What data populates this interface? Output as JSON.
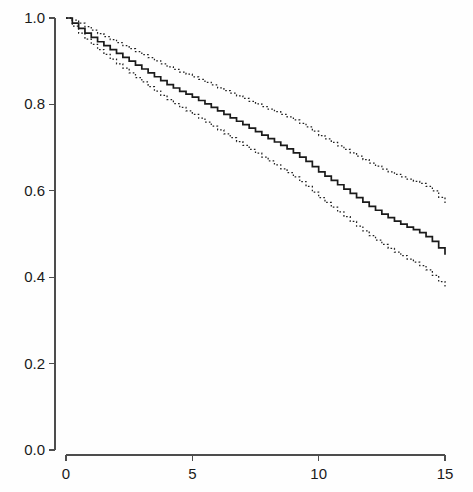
{
  "chart_data": {
    "type": "line",
    "title": "",
    "subtitle": "",
    "xlabel": "",
    "ylabel": "",
    "xlim": [
      0,
      15
    ],
    "ylim": [
      0.0,
      1.0
    ],
    "grid": false,
    "legend": "none",
    "style": "kaplan-meier survival curve with 95% confidence bands",
    "xticks": [
      0,
      5,
      10,
      15
    ],
    "xtick_labels": [
      "0",
      "5",
      "10",
      "15"
    ],
    "yticks": [
      0.0,
      0.2,
      0.4,
      0.6,
      0.8,
      1.0
    ],
    "ytick_labels": [
      "0.0",
      "0.2",
      "0.4",
      "0.6",
      "0.8",
      "1.0"
    ],
    "colors": {
      "estimate": "#1a1a1a",
      "confidence_band": "#1f1f1f",
      "axis": "#4d4d4d",
      "background": "#fefefe"
    },
    "x": [
      0,
      0.25,
      0.5,
      0.75,
      1,
      1.25,
      1.5,
      1.75,
      2,
      2.25,
      2.5,
      2.75,
      3,
      3.25,
      3.5,
      3.75,
      4,
      4.25,
      4.5,
      4.75,
      5,
      5.25,
      5.5,
      5.75,
      6,
      6.25,
      6.5,
      6.75,
      7,
      7.25,
      7.5,
      7.75,
      8,
      8.25,
      8.5,
      8.75,
      9,
      9.25,
      9.5,
      9.75,
      10,
      10.25,
      10.5,
      10.75,
      11,
      11.25,
      11.5,
      11.75,
      12,
      12.25,
      12.5,
      12.75,
      13,
      13.25,
      13.5,
      13.75,
      14,
      14.25,
      14.5,
      14.75,
      15
    ],
    "series": [
      {
        "name": "Survival estimate",
        "linestyle": "solid",
        "values": [
          1.0,
          0.988,
          0.976,
          0.965,
          0.955,
          0.945,
          0.936,
          0.927,
          0.918,
          0.909,
          0.9,
          0.891,
          0.882,
          0.873,
          0.864,
          0.855,
          0.846,
          0.838,
          0.83,
          0.824,
          0.817,
          0.809,
          0.801,
          0.793,
          0.785,
          0.777,
          0.769,
          0.761,
          0.753,
          0.745,
          0.737,
          0.729,
          0.721,
          0.713,
          0.705,
          0.697,
          0.688,
          0.678,
          0.668,
          0.656,
          0.644,
          0.634,
          0.624,
          0.614,
          0.604,
          0.594,
          0.584,
          0.574,
          0.564,
          0.555,
          0.546,
          0.538,
          0.53,
          0.523,
          0.516,
          0.51,
          0.503,
          0.494,
          0.483,
          0.468,
          0.452
        ]
      },
      {
        "name": "Upper 95% confidence limit",
        "linestyle": "dotted",
        "values": [
          1.0,
          0.995,
          0.988,
          0.98,
          0.972,
          0.964,
          0.957,
          0.95,
          0.943,
          0.936,
          0.929,
          0.922,
          0.915,
          0.908,
          0.901,
          0.894,
          0.887,
          0.881,
          0.875,
          0.87,
          0.864,
          0.858,
          0.851,
          0.845,
          0.838,
          0.832,
          0.826,
          0.82,
          0.814,
          0.807,
          0.801,
          0.795,
          0.789,
          0.783,
          0.777,
          0.771,
          0.764,
          0.756,
          0.748,
          0.738,
          0.728,
          0.72,
          0.712,
          0.704,
          0.696,
          0.688,
          0.68,
          0.672,
          0.664,
          0.657,
          0.65,
          0.644,
          0.638,
          0.632,
          0.627,
          0.622,
          0.617,
          0.61,
          0.6,
          0.585,
          0.57
        ]
      },
      {
        "name": "Lower 95% confidence limit",
        "linestyle": "dotted",
        "values": [
          1.0,
          0.981,
          0.965,
          0.951,
          0.939,
          0.927,
          0.916,
          0.905,
          0.894,
          0.884,
          0.873,
          0.862,
          0.852,
          0.841,
          0.831,
          0.821,
          0.811,
          0.802,
          0.793,
          0.785,
          0.777,
          0.768,
          0.759,
          0.75,
          0.741,
          0.732,
          0.723,
          0.714,
          0.705,
          0.696,
          0.687,
          0.678,
          0.669,
          0.66,
          0.651,
          0.642,
          0.632,
          0.621,
          0.61,
          0.597,
          0.584,
          0.573,
          0.562,
          0.551,
          0.54,
          0.529,
          0.518,
          0.507,
          0.496,
          0.486,
          0.476,
          0.467,
          0.458,
          0.45,
          0.442,
          0.435,
          0.427,
          0.417,
          0.404,
          0.39,
          0.375
        ]
      }
    ]
  },
  "axes": {
    "x_axis_name": "time-axis",
    "y_axis_name": "survival-probability-axis"
  }
}
